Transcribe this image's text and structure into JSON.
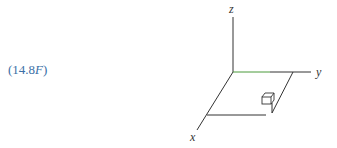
{
  "equation_label": {
    "prefix": "(14.8",
    "italic": "F",
    "suffix": ")"
  },
  "diagram": {
    "axes": {
      "x_label": "x",
      "y_label": "y",
      "z_label": "z"
    },
    "colors": {
      "label": "#3b6fa6",
      "lines": "#333333",
      "highlight": "#2e8b2e"
    }
  }
}
